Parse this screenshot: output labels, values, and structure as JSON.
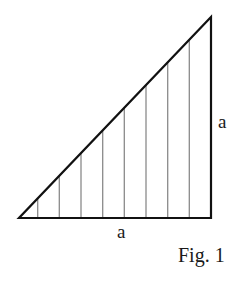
{
  "diagram": {
    "type": "right-triangle-with-hatching",
    "colors": {
      "outline": "#111111",
      "hatch": "#8a8a8a",
      "background": "#ffffff"
    },
    "triangle": {
      "vertices": [
        [
          19,
          218
        ],
        [
          211,
          218
        ],
        [
          211,
          17
        ]
      ]
    },
    "hatch_lines_x": [
      37.7,
      59.3,
      81,
      102.7,
      124.3,
      146,
      167.7,
      189.3
    ],
    "labels": {
      "base": "a",
      "height": "a",
      "caption": "Fig. 1"
    }
  }
}
